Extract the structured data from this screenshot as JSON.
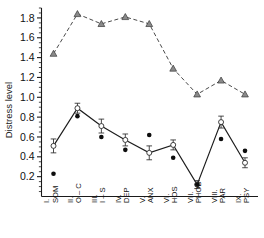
{
  "chart_data": {
    "type": "line",
    "title": "",
    "xlabel": "",
    "ylabel": "Distress level",
    "ylim": [
      0.0,
      1.9
    ],
    "yticks": [
      0.2,
      0.4,
      0.6,
      0.8,
      1.0,
      1.2,
      1.4,
      1.6,
      1.8
    ],
    "ytick_labels": [
      "0.2",
      "0.4",
      "0.6",
      "0.8",
      "1.0",
      "1.2",
      "1.4",
      "1.6",
      "1.8"
    ],
    "minor_tick_step": 0.05,
    "grid": false,
    "legend": "none",
    "categories": [
      "I. SOM",
      "II. O-C",
      "III. I-S",
      "IV. DEP",
      "V. ANX",
      "VI. HOS",
      "VII. PHOB",
      "VIII. PAR",
      "IX. PSY"
    ],
    "category_roman": [
      "I.",
      "II.",
      "III.",
      "IV.",
      "V.",
      "VI.",
      "VII.",
      "VIII.",
      "IX."
    ],
    "category_abbr": [
      "SOM",
      "O – C",
      "I – S",
      "DEP",
      "ANX",
      "HOS",
      "PHOB",
      "PAR",
      "PSY"
    ],
    "series": [
      {
        "name": "upper-dashed-triangles",
        "marker": "triangle",
        "linestyle": "dashed",
        "color": "#4a4a4a",
        "values": [
          1.44,
          1.84,
          1.74,
          1.81,
          1.74,
          1.29,
          1.03,
          1.17,
          1.03
        ],
        "errors": [
          0.0,
          0.0,
          0.0,
          0.0,
          0.0,
          0.0,
          0.0,
          0.0,
          0.0
        ]
      },
      {
        "name": "lower-solid-open-circles",
        "marker": "open-circle",
        "linestyle": "solid",
        "color": "#1d1d1d",
        "values": [
          0.51,
          0.89,
          0.71,
          0.57,
          0.44,
          0.52,
          0.12,
          0.75,
          0.34
        ],
        "errors": [
          0.07,
          0.05,
          0.07,
          0.06,
          0.07,
          0.05,
          0.04,
          0.06,
          0.05
        ]
      },
      {
        "name": "filled-dots",
        "marker": "filled-circle",
        "linestyle": "none",
        "color": "#0d0d0d",
        "values": [
          0.23,
          0.81,
          0.6,
          0.47,
          0.62,
          0.39,
          0.12,
          0.58,
          0.46
        ],
        "errors": [
          0.0,
          0.0,
          0.0,
          0.0,
          0.0,
          0.0,
          0.0,
          0.0,
          0.0
        ]
      }
    ]
  }
}
